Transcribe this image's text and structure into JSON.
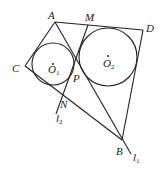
{
  "diagram": {
    "type": "geometry",
    "points": {
      "A": {
        "label": "A",
        "x": 55,
        "y": 22
      },
      "M": {
        "label": "M",
        "x": 88,
        "y": 25
      },
      "D": {
        "label": "D",
        "x": 143,
        "y": 30
      },
      "C": {
        "label": "C",
        "x": 25,
        "y": 66
      },
      "P": {
        "label": "P",
        "x": 74,
        "y": 72
      },
      "N": {
        "label": "N",
        "x": 61,
        "y": 96
      },
      "B": {
        "label": "B",
        "x": 122,
        "y": 140
      }
    },
    "circles": [
      {
        "name": "O1",
        "label": "O",
        "sub": "1",
        "cx": 53,
        "cy": 64,
        "r": 21
      },
      {
        "name": "O2",
        "label": "O",
        "sub": "2",
        "cx": 108,
        "cy": 57,
        "r": 29
      }
    ],
    "lines": [
      {
        "name": "l1",
        "label": "l",
        "sub": "1"
      },
      {
        "name": "l2",
        "label": "l",
        "sub": "2"
      }
    ]
  }
}
